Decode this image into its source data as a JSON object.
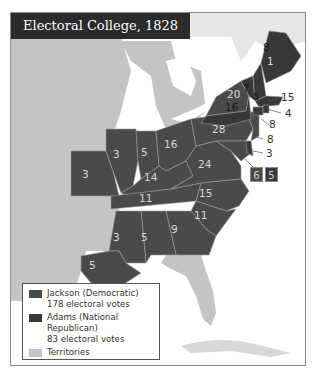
{
  "title": "Electoral College, 1828",
  "colors": {
    "jackson": "#4a4a4a",
    "adams": "#383838",
    "territories": "#c4c4c4",
    "water": "#ffffff",
    "title_bg": "#2b2b2b"
  },
  "states": {
    "maine_adams": "8",
    "maine_jackson": "1",
    "new_hampshire": "8",
    "vermont": "7",
    "massachusetts": "15",
    "rhode_island": "4",
    "connecticut": "8",
    "new_jersey": "8",
    "delaware": "3",
    "maryland_jackson": "6",
    "maryland_adams": "5",
    "new_york_adams": "16",
    "new_york_jackson": "20",
    "pennsylvania": "28",
    "ohio": "16",
    "indiana": "5",
    "illinois": "3",
    "missouri": "3",
    "kentucky": "14",
    "virginia": "24",
    "tennessee": "11",
    "north_carolina": "15",
    "south_carolina": "11",
    "georgia": "9",
    "alabama": "5",
    "mississippi": "3",
    "louisiana": "5"
  },
  "legend": {
    "items": [
      {
        "label": "Jackson (Democratic)",
        "sublabel": "178 electoral votes"
      },
      {
        "label": "Adams (National Republican)",
        "sublabel": "83 electoral votes"
      },
      {
        "label": "Territories",
        "sublabel": ""
      }
    ]
  }
}
